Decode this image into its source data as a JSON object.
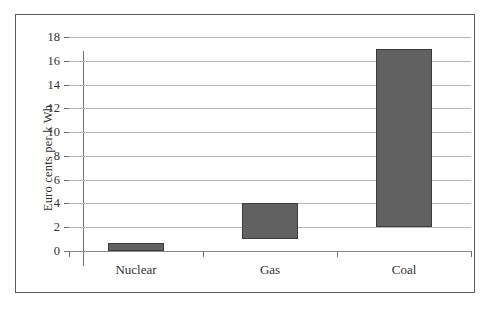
{
  "chart_data": {
    "type": "bar",
    "title": "",
    "subtitle": "",
    "xlabel": "",
    "ylabel": "Euro cents per k Wh",
    "categories": [
      "Nuclear",
      "Gas",
      "Coal"
    ],
    "bars": [
      {
        "category": "Nuclear",
        "low": 0,
        "high": 0.7
      },
      {
        "category": "Gas",
        "low": 1,
        "high": 4
      },
      {
        "category": "Coal",
        "low": 2,
        "high": 17
      }
    ],
    "values": [
      0.7,
      4,
      17
    ],
    "ylim": [
      0,
      18
    ],
    "ytick_step": 2,
    "yticks": [
      0,
      2,
      4,
      6,
      8,
      10,
      12,
      14,
      16,
      18
    ],
    "ytick_labels": [
      "0",
      "2",
      "4",
      "6",
      "8",
      "10",
      "12",
      "14",
      "16",
      "18"
    ],
    "grid": "horizontal",
    "legend": "none",
    "bar_color": "#616161",
    "bar_edge_color": "#3c3c3c",
    "gridline_color": "#b5b5b5",
    "axis_color": "#6e6e6e",
    "frame_color": "#5a5a5a",
    "background_color": "#ffffff",
    "text_color": "#33312f",
    "annotations": []
  }
}
